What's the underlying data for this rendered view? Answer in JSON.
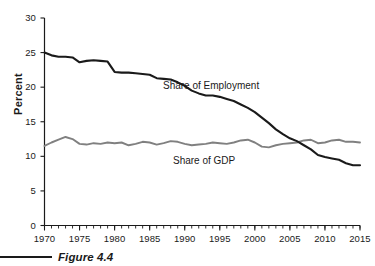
{
  "figure": {
    "caption": "Figure 4.4",
    "ylabel": "Percent",
    "series_labels": {
      "employment": "Share of Employment",
      "gdp": "Share of GDP"
    }
  },
  "colors": {
    "employment_line": "#1a1a1a",
    "gdp_line": "#808080",
    "axis": "#1a1a1a",
    "background": "#ffffff"
  },
  "yticks": [
    "0",
    "5",
    "10",
    "15",
    "20",
    "25",
    "30"
  ],
  "xticks": [
    "1970",
    "1975",
    "1980",
    "1985",
    "1990",
    "1995",
    "2000",
    "2005",
    "2010",
    "2015"
  ],
  "chart_data": {
    "type": "line",
    "title": "",
    "xlabel": "",
    "ylabel": "Percent",
    "xlim": [
      1970,
      2015
    ],
    "ylim": [
      0,
      30
    ],
    "grid": false,
    "legend": "inline-annotations",
    "x": [
      1970,
      1971,
      1972,
      1973,
      1974,
      1975,
      1976,
      1977,
      1978,
      1979,
      1980,
      1981,
      1982,
      1983,
      1984,
      1985,
      1986,
      1987,
      1988,
      1989,
      1990,
      1991,
      1992,
      1993,
      1994,
      1995,
      1996,
      1997,
      1998,
      1999,
      2000,
      2001,
      2002,
      2003,
      2004,
      2005,
      2006,
      2007,
      2008,
      2009,
      2010,
      2011,
      2012,
      2013,
      2014,
      2015
    ],
    "series": [
      {
        "name": "Share of Employment",
        "color": "#1a1a1a",
        "values": [
          25.0,
          24.6,
          24.4,
          24.4,
          24.3,
          23.6,
          23.8,
          23.9,
          23.8,
          23.7,
          22.2,
          22.1,
          22.1,
          22.0,
          21.9,
          21.8,
          21.3,
          21.2,
          21.1,
          20.7,
          20.2,
          19.5,
          19.1,
          18.8,
          18.8,
          18.6,
          18.3,
          18.0,
          17.5,
          17.0,
          16.4,
          15.6,
          14.8,
          13.9,
          13.2,
          12.6,
          12.2,
          11.6,
          11.0,
          10.2,
          9.9,
          9.7,
          9.5,
          9.0,
          8.7,
          8.7
        ]
      },
      {
        "name": "Share of GDP",
        "color": "#808080",
        "values": [
          11.5,
          12.0,
          12.4,
          12.8,
          12.5,
          11.8,
          11.7,
          11.9,
          11.8,
          12.0,
          11.9,
          12.0,
          11.6,
          11.8,
          12.1,
          12.0,
          11.7,
          11.9,
          12.2,
          12.1,
          11.8,
          11.6,
          11.7,
          11.8,
          12.0,
          11.9,
          11.8,
          12.0,
          12.3,
          12.4,
          12.0,
          11.4,
          11.3,
          11.6,
          11.8,
          11.9,
          12.0,
          12.3,
          12.4,
          11.9,
          12.0,
          12.3,
          12.4,
          12.1,
          12.1,
          12.0
        ]
      }
    ],
    "annotations": [
      {
        "text": "Share of Employment",
        "x": 1988,
        "y": 19.5
      },
      {
        "text": "Share of GDP",
        "x": 1991,
        "y": 10.3
      }
    ],
    "caption": "Figure 4.4"
  }
}
